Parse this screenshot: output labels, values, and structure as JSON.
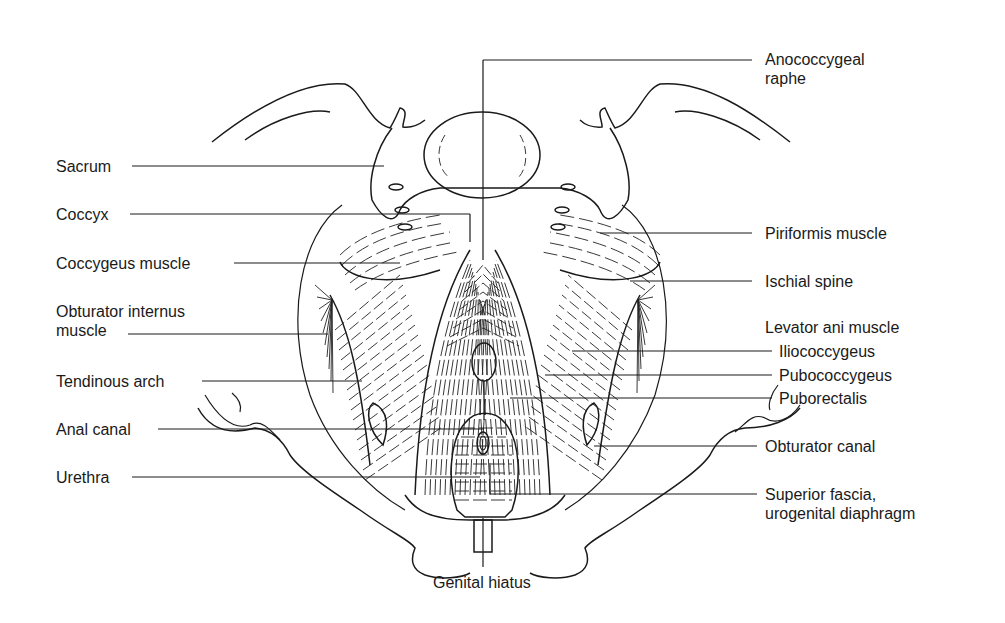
{
  "figure": {
    "labels_left": [
      {
        "id": "sacrum",
        "text": "Sacrum"
      },
      {
        "id": "coccyx",
        "text": "Coccyx"
      },
      {
        "id": "coccygeus",
        "text": "Coccygeus muscle"
      },
      {
        "id": "obturator-internus",
        "text": "Obturator internus\nmuscle"
      },
      {
        "id": "tendinous-arch",
        "text": "Tendinous arch"
      },
      {
        "id": "anal-canal",
        "text": "Anal canal"
      },
      {
        "id": "urethra",
        "text": "Urethra"
      }
    ],
    "labels_right": [
      {
        "id": "anococcygeal-raphe",
        "text": "Anococcygeal\nraphe"
      },
      {
        "id": "piriformis",
        "text": "Piriformis muscle"
      },
      {
        "id": "ischial-spine",
        "text": "Ischial spine"
      },
      {
        "id": "levator-ani",
        "text": "Levator ani muscle"
      },
      {
        "id": "iliococcygeus",
        "text": "Iliococcygeus"
      },
      {
        "id": "pubococcygeus",
        "text": "Pubococcygeus"
      },
      {
        "id": "puborectalis",
        "text": "Puborectalis"
      },
      {
        "id": "obturator-canal",
        "text": "Obturator canal"
      },
      {
        "id": "superior-fascia",
        "text": "Superior fascia,\nurogenital diaphragm"
      }
    ],
    "labels_bottom": [
      {
        "id": "genital-hiatus",
        "text": "Genital hiatus"
      }
    ]
  }
}
